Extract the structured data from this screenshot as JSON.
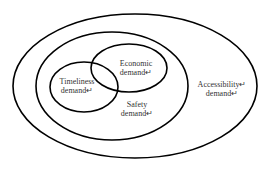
{
  "diagram": {
    "type": "nested-venn",
    "sets": [
      {
        "id": "accessibility",
        "label_line1": "Accessibility↵",
        "label_line2": "demand↵",
        "cx": 135,
        "cy": 86,
        "rx": 122,
        "ry": 72
      },
      {
        "id": "safety",
        "label_line1": "Safety",
        "label_line2": "demand↵",
        "cx": 112,
        "cy": 86,
        "rx": 76,
        "ry": 54
      },
      {
        "id": "timeliness",
        "label_line1": "Timeliness",
        "label_line2": "demand↵",
        "cx": 84,
        "cy": 87,
        "rx": 34,
        "ry": 25
      },
      {
        "id": "economic",
        "label_line1": "Economic",
        "label_line2": "demand↵",
        "cx": 129,
        "cy": 68,
        "rx": 38,
        "ry": 24
      }
    ],
    "relationships": [
      "Timeliness demand and Economic demand overlap",
      "Timeliness and Economic are contained within Safety demand",
      "Safety demand is contained within Accessibility demand"
    ],
    "stroke_color": "#000000",
    "text_color": "#333333"
  }
}
